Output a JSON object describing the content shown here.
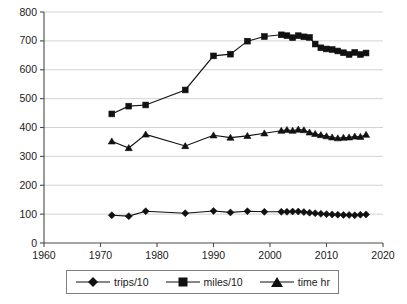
{
  "chart_data": {
    "type": "line",
    "title": "",
    "subtitle": "",
    "xlabel": "",
    "ylabel": "",
    "xlim": [
      1960,
      2020
    ],
    "ylim": [
      0,
      800
    ],
    "xticks": [
      1960,
      1970,
      1980,
      1990,
      2000,
      2010,
      2020
    ],
    "yticks": [
      0,
      100,
      200,
      300,
      400,
      500,
      600,
      700,
      800
    ],
    "grid": "horizontal",
    "legend_position": "bottom",
    "series": [
      {
        "name": "trips/10",
        "marker": "diamond",
        "x": [
          1972,
          1975,
          1978,
          1985,
          1990,
          1993,
          1996,
          1999,
          2002,
          2003,
          2004,
          2005,
          2006,
          2007,
          2008,
          2009,
          2010,
          2011,
          2012,
          2013,
          2014,
          2015,
          2016,
          2017
        ],
        "values": [
          96,
          93,
          110,
          103,
          111,
          106,
          110,
          108,
          108,
          108,
          109,
          109,
          107,
          105,
          103,
          101,
          100,
          99,
          98,
          97,
          97,
          96,
          98,
          99
        ]
      },
      {
        "name": "miles/10",
        "marker": "square",
        "x": [
          1972,
          1975,
          1978,
          1985,
          1990,
          1993,
          1996,
          1999,
          2002,
          2003,
          2004,
          2005,
          2006,
          2007,
          2008,
          2009,
          2010,
          2011,
          2012,
          2013,
          2014,
          2015,
          2016,
          2017
        ],
        "values": [
          447,
          474,
          478,
          530,
          648,
          654,
          699,
          715,
          721,
          718,
          711,
          718,
          714,
          712,
          689,
          676,
          672,
          670,
          665,
          659,
          653,
          660,
          653,
          658
        ]
      },
      {
        "name": "time hr",
        "marker": "triangle",
        "x": [
          1972,
          1975,
          1978,
          1985,
          1990,
          1993,
          1996,
          1999,
          2002,
          2003,
          2004,
          2005,
          2006,
          2007,
          2008,
          2009,
          2010,
          2011,
          2012,
          2013,
          2014,
          2015,
          2016,
          2017
        ],
        "values": [
          352,
          329,
          376,
          336,
          373,
          365,
          371,
          380,
          389,
          392,
          389,
          393,
          391,
          383,
          378,
          374,
          370,
          366,
          363,
          365,
          366,
          369,
          368,
          375
        ]
      }
    ]
  },
  "legend": {
    "entries": [
      {
        "label": "trips/10",
        "marker": "diamond"
      },
      {
        "label": "miles/10",
        "marker": "square"
      },
      {
        "label": "time hr",
        "marker": "triangle"
      }
    ]
  },
  "colors": {
    "series": "#111111",
    "grid": "#c8c8c8",
    "axis": "#4a4a4a",
    "text": "#1a1a1a",
    "background": "#ffffff",
    "legend_border": "#808080"
  }
}
